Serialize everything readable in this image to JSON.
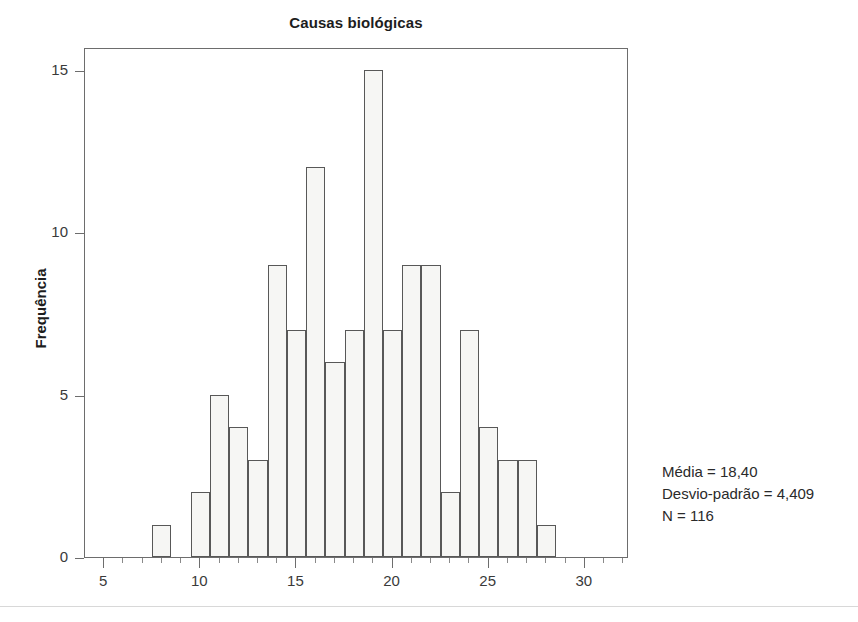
{
  "chart_data": {
    "type": "bar",
    "title": "Causas biológicas",
    "xlabel": "",
    "ylabel": "Frequência",
    "categories": [
      8,
      10,
      11,
      12,
      13,
      14,
      15,
      16,
      17,
      18,
      19,
      20,
      21,
      22,
      23,
      24,
      25,
      26,
      27,
      28
    ],
    "values": [
      1,
      2,
      5,
      4,
      3,
      9,
      7,
      12,
      6,
      7,
      15,
      7,
      9,
      9,
      2,
      7,
      4,
      3,
      3,
      1
    ],
    "xlim": [
      4,
      32.3
    ],
    "ylim": [
      0,
      15.7
    ],
    "xticks": [
      5,
      10,
      15,
      20,
      25,
      30
    ],
    "yticks": [
      0,
      5,
      10,
      15
    ],
    "xminorticks": [
      6,
      7,
      8,
      9,
      11,
      12,
      13,
      14,
      16,
      17,
      18,
      19,
      21,
      22,
      23,
      24,
      26,
      27,
      28,
      29,
      31,
      32
    ],
    "grid": false,
    "legend_position": "right-outside",
    "bin_width": 1,
    "bar_fill": "#f6f6f4",
    "bar_stroke": "#585858",
    "axis_color": "#6d6d6d"
  },
  "annotations": {
    "mean_line": "Média = 18,40",
    "sd_line": "Desvio-padrão = 4,409",
    "n_line": "N = 116"
  },
  "page": {
    "corner_mark": ""
  }
}
